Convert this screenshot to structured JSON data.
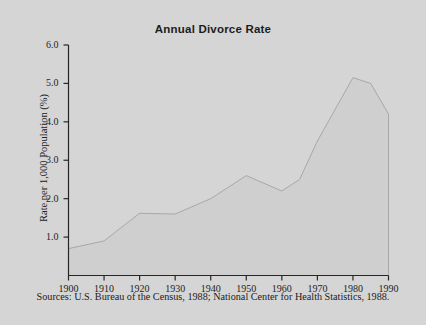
{
  "figure": {
    "title": "Annual Divorce Rate",
    "source_note": "Sources: U.S. Bureau of the Census, 1988; National Center for Health Statistics, 1988.",
    "background_color": "#d5d5d5",
    "axis_color": "#262626",
    "area_fill_color": "#cfcfcf",
    "line_color": "#a8a8a8"
  },
  "chart_data": {
    "type": "area",
    "title": "Annual Divorce Rate",
    "xlabel": "",
    "ylabel": "Rate per 1,000 Population (%)",
    "xlim": [
      1900,
      1990
    ],
    "ylim": [
      0,
      6.0
    ],
    "grid": false,
    "legend": null,
    "x_tick_labels": [
      "1900",
      "1910",
      "1920",
      "1930",
      "1940",
      "1950",
      "1960",
      "1970",
      "1980",
      "1990"
    ],
    "x_ticks": [
      1900,
      1910,
      1920,
      1930,
      1940,
      1950,
      1960,
      1970,
      1980,
      1990
    ],
    "y_tick_labels": [
      "1.0",
      "2.0",
      "3.0",
      "4.0",
      "5.0",
      "6.0"
    ],
    "y_ticks": [
      1.0,
      2.0,
      3.0,
      4.0,
      5.0,
      6.0
    ],
    "x": [
      1900,
      1910,
      1920,
      1930,
      1940,
      1950,
      1960,
      1965,
      1970,
      1980,
      1985,
      1990
    ],
    "values": [
      0.7,
      0.9,
      1.62,
      1.6,
      2.0,
      2.6,
      2.2,
      2.5,
      3.5,
      5.15,
      5.0,
      4.2
    ],
    "series": [
      {
        "name": "Annual divorce rate per 1,000 population",
        "values": [
          0.7,
          0.9,
          1.62,
          1.6,
          2.0,
          2.6,
          2.2,
          2.5,
          3.5,
          5.15,
          5.0,
          4.2
        ]
      }
    ]
  }
}
